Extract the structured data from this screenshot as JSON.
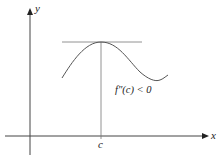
{
  "diagram": {
    "axes": {
      "x_label": "x",
      "y_label": "y"
    },
    "point_label": "c",
    "annotation": "f″(c) < 0",
    "elements": [
      "y-axis",
      "x-axis",
      "horizontal-tangent-line",
      "vertical-line-at-c",
      "curve-with-local-maximum"
    ],
    "colors": {
      "axis": "#333333",
      "curve": "#555555",
      "tangent": "#777777"
    }
  }
}
